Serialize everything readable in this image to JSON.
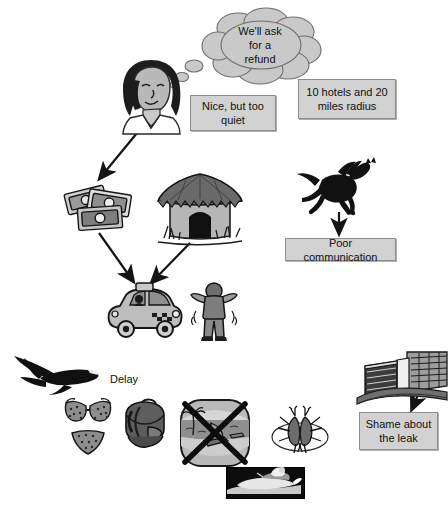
{
  "diagram": {
    "background_color": "#ffffff",
    "box_fill": "#d2d2d2",
    "box_border": "#8d8d8d",
    "ink_color": "#1a1a1a"
  },
  "thought_bubble": {
    "text": "We'll ask for a refund",
    "line1": "We'll ask",
    "line2": "for a",
    "line3": "refund"
  },
  "boxes": [
    {
      "id": "nice-but-too-quiet",
      "text": "Nice, but too quiet"
    },
    {
      "id": "hotels-and-radius",
      "text": "10 hotels and 20 miles radius"
    },
    {
      "id": "poor-communication",
      "text": "Poor communication"
    },
    {
      "id": "shame-about-the-leak",
      "text": "Shame about the leak"
    }
  ],
  "labels": [
    {
      "id": "delay",
      "text": "Delay"
    }
  ],
  "bottom_caption": {
    "text": ""
  },
  "pictures": [
    {
      "id": "customer-face",
      "name": "woman-face-icon",
      "alt": "Face of a woman thinking"
    },
    {
      "id": "banknotes",
      "name": "banknotes-icon",
      "alt": "Scattered banknotes / money"
    },
    {
      "id": "hut",
      "name": "thatched-hut-icon",
      "alt": "Thatched round hut"
    },
    {
      "id": "running-horse",
      "name": "running-horse-icon",
      "alt": "Running horse silhouette"
    },
    {
      "id": "taxi-car",
      "name": "taxi-car-icon",
      "alt": "Small taxi car"
    },
    {
      "id": "person-arms-up",
      "name": "person-arms-up-icon",
      "alt": "Person with arms raised"
    },
    {
      "id": "airplane",
      "name": "airplane-icon",
      "alt": "Airliner in flight"
    },
    {
      "id": "bikini",
      "name": "bikini-icon",
      "alt": "Bikini top and bottom"
    },
    {
      "id": "backpack",
      "name": "backpack-icon",
      "alt": "Rolled backpack / luggage"
    },
    {
      "id": "beach-crossed",
      "name": "beach-scene-crossed-icon",
      "alt": "Beach watersports scene crossed out with an X"
    },
    {
      "id": "mosquitoes",
      "name": "mosquitoes-icon",
      "alt": "Two mosquitoes / insects"
    },
    {
      "id": "hotel-building",
      "name": "hotel-building-icon",
      "alt": "Modern hotel building exterior"
    },
    {
      "id": "jet-ski",
      "name": "jet-ski-photo",
      "alt": "Photo of a jet ski on water"
    }
  ],
  "arrows": [
    {
      "id": "face-to-money",
      "from": "customer-face",
      "to": "banknotes"
    },
    {
      "id": "money-to-car",
      "from": "banknotes",
      "to": "taxi-car"
    },
    {
      "id": "horse-to-box",
      "from": "running-horse",
      "to": "poor-communication"
    },
    {
      "id": "hut-to-car",
      "from": "hut",
      "to": "taxi-car"
    },
    {
      "id": "hotel-to-leak",
      "from": "hotel-building",
      "to": "shame-about-the-leak"
    }
  ]
}
